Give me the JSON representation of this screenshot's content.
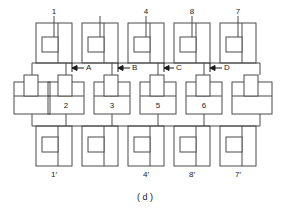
{
  "figure": {
    "caption": "( d )",
    "stroke_color": "#4a4a4a",
    "text_color": "#1a1a1a",
    "background_color": "#ffffff"
  },
  "top_row": {
    "labels": [
      "1",
      "",
      "4",
      "8",
      "7"
    ]
  },
  "middle_row": {
    "labels": [
      "",
      "2",
      "3",
      "5",
      "6",
      ""
    ]
  },
  "bottom_row": {
    "labels": [
      "1′",
      "",
      "4′",
      "8′",
      "7′"
    ]
  },
  "dimensions": {
    "labels": [
      "A",
      "B",
      "C",
      "D"
    ]
  }
}
